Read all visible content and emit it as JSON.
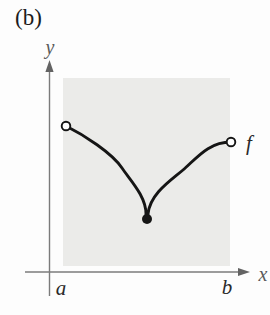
{
  "figure": {
    "panel_label": "(b)",
    "function_label": "f",
    "axis": {
      "x_label": "x",
      "y_label": "y",
      "left_tick": "a",
      "right_tick": "b"
    },
    "points": {
      "left_endpoint": {
        "style": "open-circle",
        "x_tick": "a"
      },
      "right_endpoint": {
        "style": "open-circle",
        "x_tick": "b"
      },
      "cusp_minimum": {
        "style": "filled-dot",
        "location": "between a and b"
      }
    }
  },
  "geometry": {
    "curve_path": "M 66 126 C 84 135, 112 153, 122 168 C 130 180, 146 196, 146 214 L 148 214 C 150 194, 170 181, 183 170 C 196 159, 208 142, 231 142"
  },
  "colors": {
    "background": "#fdfdfd",
    "shading": "#ebebe9",
    "axis": "#7b7b7b",
    "arrowhead": "#636363",
    "curve": "#151515",
    "panel_label": "#1c1c1c",
    "axis_letter": "#5a5a5a",
    "tick_letter": "#2a2a2a"
  }
}
